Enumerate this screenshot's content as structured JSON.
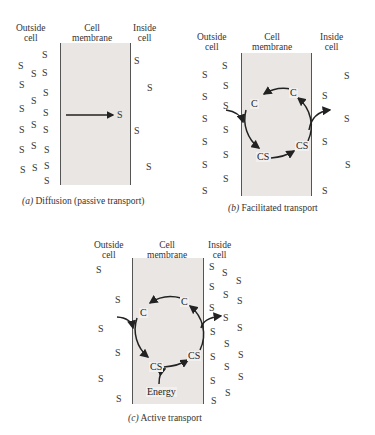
{
  "labels": {
    "outside": "Outside cell",
    "outside_l1": "Outside",
    "outside_l2": "cell",
    "membrane_l1": "Cell",
    "membrane_l2": "membrane",
    "inside_l1": "Inside",
    "inside_l2": "cell"
  },
  "molecule": "S",
  "carrier": "C",
  "complex": "CS",
  "energy": "Energy",
  "panels": {
    "a": {
      "letter": "(a)",
      "title": "Diffusion (passive transport)"
    },
    "b": {
      "letter": "(b)",
      "title": "Facilitated transport"
    },
    "c": {
      "letter": "(c)",
      "title": "Active transport"
    }
  }
}
